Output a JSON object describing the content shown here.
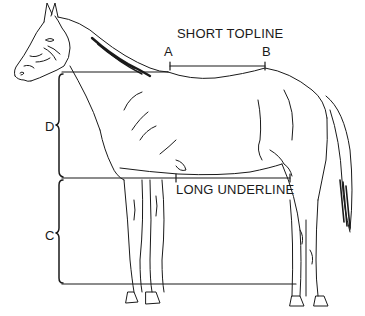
{
  "diagram": {
    "labels": {
      "topline": "SHORT TOPLINE",
      "underline": "LONG UNDERLINE",
      "point_a": "A",
      "point_b": "B",
      "depth_body": "D",
      "depth_legs": "C"
    },
    "measurements": [
      {
        "name": "topline",
        "from": "A",
        "to": "B",
        "description": "Short topline from withers to loin"
      },
      {
        "name": "underline",
        "description": "Long underline from elbow to stifle"
      },
      {
        "name": "D",
        "description": "Body depth from withers to underline"
      },
      {
        "name": "C",
        "description": "Leg length from underline to ground"
      }
    ],
    "colors": {
      "ink": "#1a1a1a",
      "background": "#ffffff"
    }
  }
}
